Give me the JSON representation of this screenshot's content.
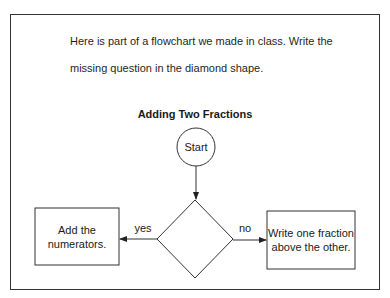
{
  "prompt": {
    "line1": "Here is part of a flowchart we made in class.  Write the",
    "line2": "missing question in the diamond shape."
  },
  "flowchart": {
    "title": "Adding Two Fractions",
    "start": {
      "label": "Start",
      "shape": "circle"
    },
    "decision": {
      "label": "",
      "shape": "diamond"
    },
    "yes_branch": {
      "label": "yes",
      "box_lines": [
        "Add the",
        "numerators."
      ]
    },
    "no_branch": {
      "label": "no",
      "box_lines": [
        "Write one fraction",
        "above the other."
      ]
    }
  },
  "colors": {
    "stroke": "#333333",
    "text": "#1a1a1a",
    "background": "#ffffff"
  }
}
